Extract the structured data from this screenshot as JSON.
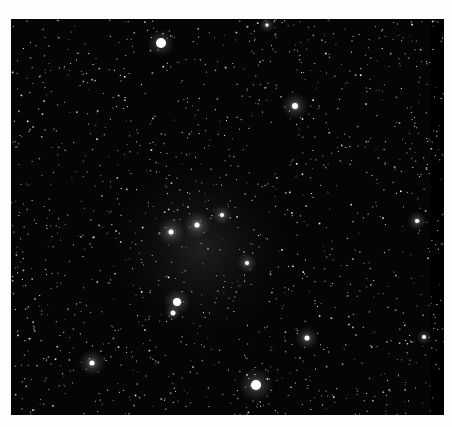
{
  "image": {
    "subject": "star field",
    "background_color": "#fdfdfd",
    "sky_color": "#050505",
    "frame": {
      "x": 11,
      "y": 19,
      "width": 433,
      "height": 396
    },
    "bright_stars": [
      {
        "x": 150,
        "y": 24,
        "r": 5,
        "glow": 14
      },
      {
        "x": 284,
        "y": 87,
        "r": 3,
        "glow": 14
      },
      {
        "x": 236,
        "y": 244,
        "r": 2,
        "glow": 10
      },
      {
        "x": 186,
        "y": 206,
        "r": 2.5,
        "glow": 14
      },
      {
        "x": 160,
        "y": 213,
        "r": 2.5,
        "glow": 14
      },
      {
        "x": 211,
        "y": 196,
        "r": 2,
        "glow": 10
      },
      {
        "x": 166,
        "y": 283,
        "r": 4,
        "glow": 14
      },
      {
        "x": 162,
        "y": 294,
        "r": 2.5,
        "glow": 8
      },
      {
        "x": 81,
        "y": 344,
        "r": 2.5,
        "glow": 14
      },
      {
        "x": 245,
        "y": 366,
        "r": 5,
        "glow": 18
      },
      {
        "x": 296,
        "y": 319,
        "r": 2.5,
        "glow": 12
      },
      {
        "x": 406,
        "y": 202,
        "r": 2,
        "glow": 10
      },
      {
        "x": 413,
        "y": 318,
        "r": 2,
        "glow": 8
      },
      {
        "x": 256,
        "y": 6,
        "r": 1.5,
        "glow": 8
      }
    ]
  }
}
